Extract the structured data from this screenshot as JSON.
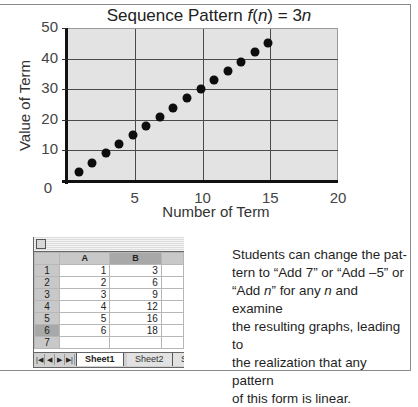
{
  "chart_data": {
    "type": "scatter",
    "title": "Sequence Pattern  f(n) = 3n",
    "title_parts": {
      "prefix": "Sequence Pattern  ",
      "func": "f",
      "open": "(",
      "var": "n",
      "close": ") = 3",
      "var2": "n"
    },
    "xlabel": "Number of Term",
    "ylabel": "Value of Term",
    "xlim": [
      0,
      20
    ],
    "ylim": [
      0,
      50
    ],
    "x_ticks": [
      0,
      5,
      10,
      15,
      20
    ],
    "y_ticks": [
      0,
      10,
      20,
      30,
      40,
      50
    ],
    "grid": true,
    "legend": null,
    "x": [
      1,
      2,
      3,
      4,
      5,
      6,
      7,
      8,
      9,
      10,
      11,
      12,
      13,
      14,
      15
    ],
    "y": [
      3,
      6,
      9,
      12,
      15,
      18,
      21,
      24,
      27,
      30,
      33,
      36,
      39,
      42,
      45
    ],
    "marker_color": "#0d0d0d",
    "plot_background": "#e3e3e3"
  },
  "axis_labels": {
    "x": [
      "5",
      "10",
      "15",
      "20"
    ],
    "y": [
      "0",
      "10",
      "20",
      "30",
      "40",
      "50"
    ]
  },
  "spreadsheet": {
    "columns": [
      "A",
      "B"
    ],
    "rows": [
      {
        "num": "1",
        "a": "1",
        "b": "3"
      },
      {
        "num": "2",
        "a": "2",
        "b": "6"
      },
      {
        "num": "3",
        "a": "3",
        "b": "9"
      },
      {
        "num": "4",
        "a": "4",
        "b": "12"
      },
      {
        "num": "5",
        "a": "5",
        "b": "16"
      },
      {
        "num": "6",
        "a": "6",
        "b": "18"
      },
      {
        "num": "7",
        "a": "",
        "b": ""
      }
    ],
    "tabs": [
      "Sheet1",
      "Sheet2",
      "S"
    ],
    "nav": [
      "|◀",
      "◀",
      "▶",
      "▶|"
    ]
  },
  "caption": {
    "line1": "Students can change the pat-",
    "line2": "tern to “Add 7” or “Add –5” or",
    "line3_a": "“Add ",
    "line3_n1": "n",
    "line3_b": "” for any ",
    "line3_n2": "n",
    "line3_c": " and examine",
    "line4": "the resulting graphs, leading to",
    "line5": "the realization that any pattern",
    "line6": "of this form is linear."
  }
}
